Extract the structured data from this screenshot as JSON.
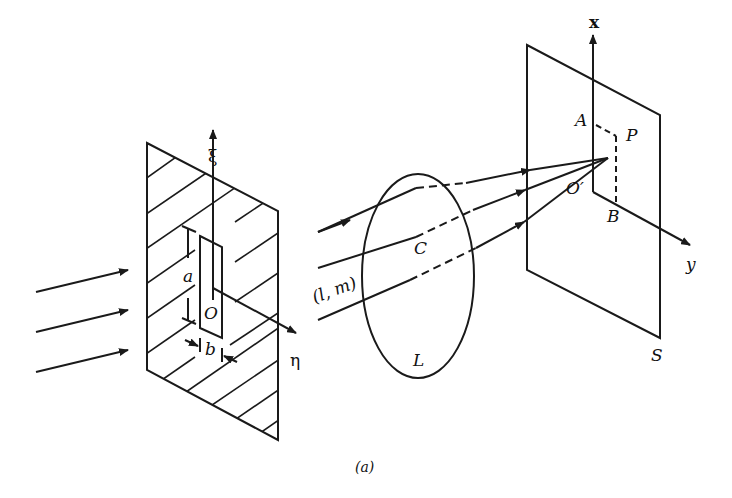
{
  "diagram": {
    "caption": "(a)",
    "labels": {
      "xi": "ξ",
      "eta": "η",
      "a": "a",
      "b": "b",
      "O": "O",
      "C": "C",
      "lm": "(l, m)",
      "L": "L",
      "x": "x",
      "y": "y",
      "A": "A",
      "P": "P",
      "O_prime": "O′",
      "B": "B",
      "S": "S"
    },
    "elements": [
      "aperture-screen-with-slit",
      "lens-L",
      "observation-screen-S",
      "incident-rays",
      "focused-rays-to-P"
    ],
    "colors": {
      "ink": "#1a1a1a",
      "background": "#ffffff"
    }
  }
}
